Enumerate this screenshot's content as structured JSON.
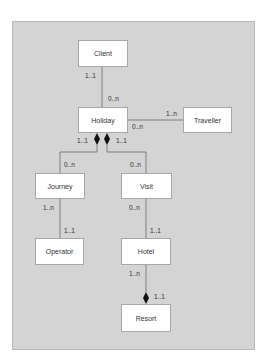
{
  "diagram": {
    "type": "UML class diagram",
    "entities": {
      "client": "Client",
      "holiday": "Holiday",
      "traveller": "Traveller",
      "journey": "Journey",
      "visit": "Visit",
      "operator": "Operator",
      "hotel": "Hotel",
      "resort": "Resort"
    },
    "multiplicities": {
      "client_holiday_client": "1..1",
      "client_holiday_holiday": "0..n",
      "holiday_traveller_traveller": "1..n",
      "holiday_traveller_holiday": "0..n",
      "holiday_journey_holiday": "1..1",
      "holiday_journey_journey": "0..n",
      "holiday_visit_holiday": "1..1",
      "holiday_visit_visit": "0..n",
      "journey_operator_journey": "1..n",
      "journey_operator_operator": "1..1",
      "visit_hotel_visit": "0..n",
      "visit_hotel_hotel": "1..1",
      "hotel_resort_hotel": "1..n",
      "hotel_resort_resort": "1..1"
    },
    "relationships": [
      {
        "from": "Client",
        "to": "Holiday",
        "kind": "association"
      },
      {
        "from": "Holiday",
        "to": "Traveller",
        "kind": "association"
      },
      {
        "from": "Holiday",
        "to": "Journey",
        "kind": "composition"
      },
      {
        "from": "Holiday",
        "to": "Visit",
        "kind": "composition"
      },
      {
        "from": "Journey",
        "to": "Operator",
        "kind": "association"
      },
      {
        "from": "Visit",
        "to": "Hotel",
        "kind": "association"
      },
      {
        "from": "Resort",
        "to": "Hotel",
        "kind": "composition"
      }
    ]
  }
}
